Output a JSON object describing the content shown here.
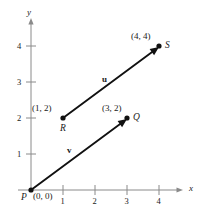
{
  "figure": {
    "type": "vector-diagram",
    "background_color": "#ffffff",
    "ink_color": "#1a1a1a",
    "axis_color": "#7a7a7a",
    "axes": {
      "x_label": "x",
      "y_label": "y",
      "x_ticks": [
        "1",
        "2",
        "3",
        "4"
      ],
      "y_ticks": [
        "1",
        "2",
        "3",
        "4"
      ],
      "x_range": [
        0,
        4.7
      ],
      "y_range": [
        0,
        4.9
      ]
    },
    "points": [
      {
        "name": "P",
        "coord_label": "(0, 0)",
        "x": 0,
        "y": 0
      },
      {
        "name": "Q",
        "coord_label": "(3, 2)",
        "x": 3,
        "y": 2
      },
      {
        "name": "R",
        "coord_label": "(1, 2)",
        "x": 1,
        "y": 2
      },
      {
        "name": "S",
        "coord_label": "(4, 4)",
        "x": 4,
        "y": 4
      }
    ],
    "vectors": [
      {
        "name": "u",
        "from": "R",
        "to": "S",
        "components": [
          3,
          2
        ]
      },
      {
        "name": "v",
        "from": "P",
        "to": "Q",
        "components": [
          3,
          2
        ]
      }
    ]
  }
}
